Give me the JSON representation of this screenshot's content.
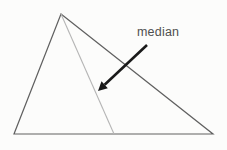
{
  "diagram": {
    "label": "median",
    "triangle": {
      "points": "61,14 14,134 213,134"
    },
    "median": {
      "path": "M 61,14 L 114,134"
    },
    "arrow": {
      "shaft_path": "M 147,45 L 104.6,84.8",
      "head_points": "98,91 101.5,81.3 107.8,88.2"
    }
  },
  "colors": {
    "background": "#fcfcfb",
    "triangle_stroke": "#606060",
    "median_stroke": "#b5b5b5",
    "arrow_color": "#1a1a1a",
    "label_color": "#4f4f4f"
  }
}
